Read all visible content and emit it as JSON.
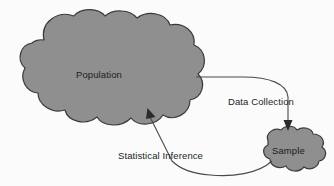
{
  "diagram": {
    "background_color": "#fbfbfb",
    "nodes": [
      {
        "id": "population",
        "label": "Population",
        "shape": "cloud",
        "fill_color": "#8f8f8f",
        "stroke_color": "#3a3a3a",
        "size": "large"
      },
      {
        "id": "sample",
        "label": "Sample",
        "shape": "cloud",
        "fill_color": "#8f8f8f",
        "stroke_color": "#3a3a3a",
        "size": "small"
      }
    ],
    "edges": [
      {
        "id": "data-collection",
        "label": "Data Collection",
        "from": "population",
        "to": "sample",
        "arrow": "down",
        "stroke_color": "#4a4a4a"
      },
      {
        "id": "statistical-inference",
        "label": "Statistical Inference",
        "from": "sample",
        "to": "population",
        "arrow": "up",
        "stroke_color": "#4a4a4a"
      }
    ]
  }
}
